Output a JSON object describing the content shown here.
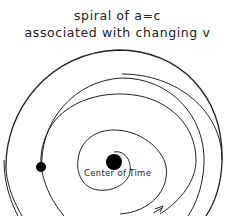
{
  "title": {
    "line1": "spiral of a=c",
    "line2": "associated with changing v"
  },
  "diagram": {
    "center_label": "Center of Time",
    "elements": [
      "spiral",
      "center-dot",
      "orbiting-dot",
      "direction-arrow"
    ]
  }
}
